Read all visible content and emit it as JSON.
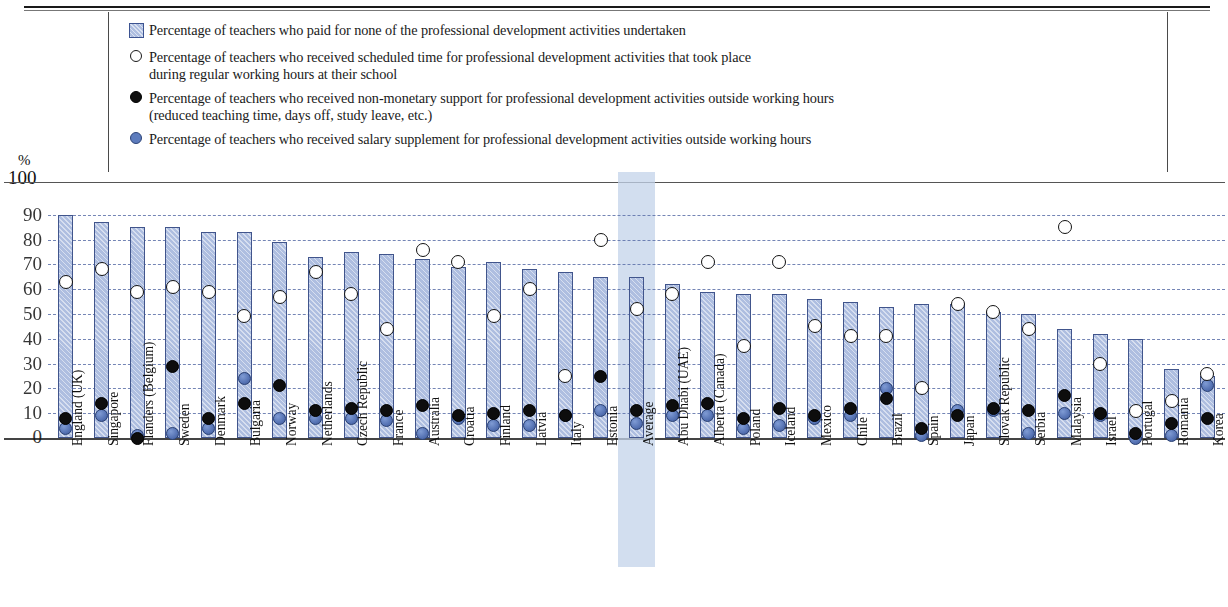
{
  "legend": {
    "items": [
      {
        "marker": "bar-swatch-icon",
        "line1": "Percentage of teachers who paid for none of the professional development activities undertaken",
        "line2": ""
      },
      {
        "marker": "open-circle-icon",
        "line1": "Percentage of teachers who received scheduled time for professional development activities that took place",
        "line2": "during regular working hours at their school"
      },
      {
        "marker": "black-circle-icon",
        "line1": "Percentage of teachers who received non-monetary support for professional development activities outside working hours",
        "line2": "(reduced teaching time, days off, study leave, etc.)"
      },
      {
        "marker": "blue-circle-icon",
        "line1": "Percentage of teachers who received salary supplement for professional development activities outside working hours",
        "line2": ""
      }
    ]
  },
  "axis": {
    "unit_label": "%",
    "top_label": "100",
    "ticks": [
      "90",
      "80",
      "70",
      "60",
      "50",
      "40",
      "30",
      "20",
      "10",
      "0"
    ]
  },
  "colors": {
    "bar_fill": "#aebee0",
    "bar_border": "#41558c",
    "open_marker": "#ffffff",
    "black_marker": "#0d0d0d",
    "blue_marker": "#5d7cbd",
    "highlight_band": "#c3d3ea",
    "gridline": "#5b6fa8"
  },
  "highlight_category": "Average",
  "chart_data": {
    "type": "bar",
    "title": "",
    "xlabel": "",
    "ylabel": "%",
    "ylim": [
      0,
      100
    ],
    "grid": true,
    "legend_position": "top",
    "categories": [
      "England (UK)",
      "Singapore",
      "Flanders (Belgium)",
      "Sweden",
      "Denmark",
      "Bulgaria",
      "Norway",
      "Netherlands",
      "Czech Republic",
      "France",
      "Australia",
      "Croatia",
      "Finland",
      "Latvia",
      "Italy",
      "Estonia",
      "Average",
      "Abu Dhabi (UAE)",
      "Alberta (Canada)",
      "Poland",
      "Iceland",
      "Mexico",
      "Chile",
      "Brazil",
      "Spain",
      "Japan",
      "Slovak Republic",
      "Serbia",
      "Malaysia",
      "Israel",
      "Portugal",
      "Romania",
      "Korea"
    ],
    "series": [
      {
        "name": "Percentage of teachers who paid for none of the professional development activities undertaken",
        "type": "bar",
        "values": [
          90,
          87,
          85,
          85,
          83,
          83,
          79,
          73,
          75,
          74,
          72,
          69,
          71,
          68,
          67,
          65,
          65,
          62,
          59,
          58,
          58,
          56,
          55,
          53,
          54,
          54,
          51,
          50,
          44,
          42,
          40,
          28,
          25
        ]
      },
      {
        "name": "Percentage of teachers who received scheduled time for professional development activities that took place during regular working hours at their school",
        "type": "scatter-open",
        "values": [
          63,
          68,
          59,
          61,
          59,
          49,
          57,
          67,
          58,
          44,
          76,
          71,
          49,
          60,
          25,
          80,
          52,
          58,
          71,
          37,
          71,
          45,
          41,
          41,
          20,
          54,
          51,
          44,
          85,
          30,
          11,
          15,
          26
        ]
      },
      {
        "name": "Percentage of teachers who received non-monetary support for professional development activities outside working hours (reduced teaching time, days off, study leave, etc.)",
        "type": "scatter-black",
        "values": [
          8,
          14,
          0,
          29,
          8,
          14,
          21,
          11,
          12,
          11,
          13,
          9,
          10,
          11,
          9,
          25,
          11,
          13,
          14,
          8,
          12,
          9,
          12,
          16,
          4,
          9,
          12,
          11,
          17,
          10,
          2,
          6,
          8
        ]
      },
      {
        "name": "Percentage of teachers who received salary supplement for professional development activities outside working hours",
        "type": "scatter-blue",
        "values": [
          4,
          9,
          1,
          2,
          4,
          24,
          8,
          8,
          8,
          7,
          2,
          8,
          5,
          5,
          9,
          11,
          6,
          9,
          9,
          4,
          5,
          8,
          9,
          20,
          1,
          11,
          11,
          2,
          10,
          9,
          0,
          1,
          21
        ]
      }
    ]
  }
}
